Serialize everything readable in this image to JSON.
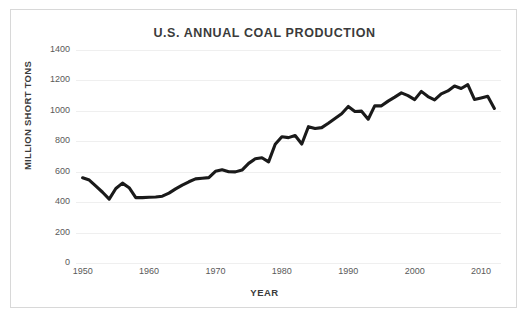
{
  "chart_data": {
    "type": "line",
    "title": "U.S. ANNUAL COAL PRODUCTION",
    "xlabel": "YEAR",
    "ylabel": "MILLION SHORT TONS",
    "xlim": [
      1949,
      2013
    ],
    "ylim": [
      0,
      1400
    ],
    "ytick_labels": [
      "1400",
      "1200",
      "1000",
      "800",
      "600",
      "400",
      "200",
      "0"
    ],
    "ytick_values": [
      1400,
      1200,
      1000,
      800,
      600,
      400,
      200,
      0
    ],
    "xtick_labels": [
      "1950",
      "1960",
      "1970",
      "1980",
      "1990",
      "2000",
      "2010"
    ],
    "xtick_values": [
      1950,
      1960,
      1970,
      1980,
      1990,
      2000,
      2010
    ],
    "grid": "horizontal",
    "legend": "none",
    "line_color": "#1a1a1a",
    "series": [
      {
        "name": "U.S. annual coal production",
        "x": [
          1950,
          1951,
          1952,
          1953,
          1954,
          1955,
          1956,
          1957,
          1958,
          1959,
          1960,
          1961,
          1962,
          1963,
          1964,
          1965,
          1966,
          1967,
          1968,
          1969,
          1970,
          1971,
          1972,
          1973,
          1974,
          1975,
          1976,
          1977,
          1978,
          1979,
          1980,
          1981,
          1982,
          1983,
          1984,
          1985,
          1986,
          1987,
          1988,
          1989,
          1990,
          1991,
          1992,
          1993,
          1994,
          1995,
          1996,
          1997,
          1998,
          1999,
          2000,
          2001,
          2002,
          2003,
          2004,
          2005,
          2006,
          2007,
          2008,
          2009,
          2010,
          2011,
          2012
        ],
        "values": [
          560,
          545,
          505,
          465,
          420,
          490,
          525,
          495,
          430,
          430,
          432,
          434,
          439,
          459,
          487,
          512,
          534,
          553,
          557,
          561,
          603,
          613,
          600,
          599,
          611,
          655,
          685,
          692,
          665,
          781,
          830,
          824,
          838,
          782,
          896,
          884,
          890,
          919,
          950,
          981,
          1029,
          996,
          998,
          945,
          1034,
          1033,
          1064,
          1090,
          1118,
          1100,
          1074,
          1128,
          1094,
          1072,
          1112,
          1131,
          1163,
          1147,
          1172,
          1075,
          1085,
          1096,
          1016
        ]
      }
    ]
  },
  "colors": {
    "line": "#1a1a1a",
    "grid": "#efefef",
    "text": "#3b3b3b",
    "tick_text": "#595959",
    "border": "#d8d8d8",
    "background": "#ffffff"
  }
}
